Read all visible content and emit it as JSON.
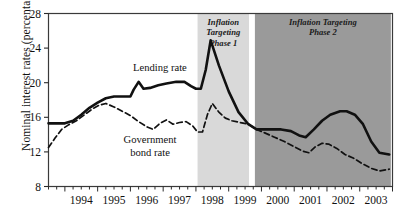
{
  "chart_data": {
    "type": "line",
    "title": "",
    "xlabel": "",
    "ylabel": "Nominal interest rates (percentages)",
    "ylim": [
      8,
      28
    ],
    "yticks": [
      8,
      12,
      16,
      20,
      24,
      28
    ],
    "xlim": [
      1993.5,
      2004.0
    ],
    "xticks": [
      1994,
      1995,
      1996,
      1997,
      1998,
      1999,
      2000,
      2001,
      2002,
      2003
    ],
    "xtick_labels": [
      "1994",
      "1995",
      "1996",
      "1997",
      "1998",
      "1999",
      "2000",
      "2001",
      "2002",
      "2003"
    ],
    "grid": false,
    "legend_position": "inline-annotations",
    "series": [
      {
        "name": "Lending rate",
        "style": "solid",
        "color": "#111111",
        "points": [
          [
            1993.5,
            15.3
          ],
          [
            1993.75,
            15.3
          ],
          [
            1994.0,
            15.3
          ],
          [
            1994.25,
            15.6
          ],
          [
            1994.5,
            16.3
          ],
          [
            1994.75,
            17.1
          ],
          [
            1995.0,
            17.7
          ],
          [
            1995.25,
            18.2
          ],
          [
            1995.5,
            18.4
          ],
          [
            1995.75,
            18.4
          ],
          [
            1996.0,
            18.4
          ],
          [
            1996.1,
            19.2
          ],
          [
            1996.25,
            20.1
          ],
          [
            1996.4,
            19.3
          ],
          [
            1996.6,
            19.4
          ],
          [
            1996.85,
            19.7
          ],
          [
            1997.1,
            19.9
          ],
          [
            1997.4,
            20.1
          ],
          [
            1997.65,
            20.1
          ],
          [
            1997.85,
            19.6
          ],
          [
            1998.0,
            19.3
          ],
          [
            1998.15,
            19.3
          ],
          [
            1998.3,
            21.5
          ],
          [
            1998.45,
            24.9
          ],
          [
            1998.7,
            22.0
          ],
          [
            1999.0,
            19.0
          ],
          [
            1999.3,
            16.6
          ],
          [
            1999.6,
            15.2
          ],
          [
            1999.85,
            14.6
          ],
          [
            2000.2,
            14.6
          ],
          [
            2000.6,
            14.6
          ],
          [
            2000.9,
            14.4
          ],
          [
            2001.15,
            13.9
          ],
          [
            2001.35,
            13.7
          ],
          [
            2001.6,
            14.6
          ],
          [
            2001.85,
            15.6
          ],
          [
            2002.1,
            16.3
          ],
          [
            2002.4,
            16.7
          ],
          [
            2002.6,
            16.7
          ],
          [
            2002.85,
            16.3
          ],
          [
            2003.1,
            15.2
          ],
          [
            2003.35,
            13.2
          ],
          [
            2003.6,
            11.9
          ],
          [
            2003.9,
            11.7
          ]
        ]
      },
      {
        "name": "Government bond rate",
        "style": "dashed",
        "color": "#111111",
        "points": [
          [
            1993.5,
            12.5
          ],
          [
            1993.7,
            13.6
          ],
          [
            1993.9,
            14.6
          ],
          [
            1994.1,
            15.1
          ],
          [
            1994.35,
            15.6
          ],
          [
            1994.6,
            16.3
          ],
          [
            1994.85,
            17.0
          ],
          [
            1995.05,
            17.4
          ],
          [
            1995.25,
            17.6
          ],
          [
            1995.5,
            17.2
          ],
          [
            1995.75,
            16.7
          ],
          [
            1996.0,
            16.2
          ],
          [
            1996.25,
            15.5
          ],
          [
            1996.5,
            14.9
          ],
          [
            1996.7,
            14.6
          ],
          [
            1996.9,
            15.3
          ],
          [
            1997.1,
            15.7
          ],
          [
            1997.3,
            15.2
          ],
          [
            1997.5,
            15.4
          ],
          [
            1997.7,
            15.5
          ],
          [
            1997.9,
            15.0
          ],
          [
            1998.05,
            14.3
          ],
          [
            1998.2,
            14.3
          ],
          [
            1998.35,
            16.3
          ],
          [
            1998.5,
            17.6
          ],
          [
            1998.7,
            16.6
          ],
          [
            1998.9,
            15.9
          ],
          [
            1999.1,
            15.6
          ],
          [
            1999.35,
            15.4
          ],
          [
            1999.6,
            15.2
          ],
          [
            1999.85,
            14.6
          ],
          [
            2000.1,
            14.2
          ],
          [
            2000.4,
            13.7
          ],
          [
            2000.7,
            13.2
          ],
          [
            2001.0,
            12.6
          ],
          [
            2001.25,
            12.1
          ],
          [
            2001.45,
            11.9
          ],
          [
            2001.65,
            12.6
          ],
          [
            2001.85,
            13.0
          ],
          [
            2002.05,
            12.9
          ],
          [
            2002.3,
            12.4
          ],
          [
            2002.55,
            11.7
          ],
          [
            2002.8,
            11.3
          ],
          [
            2003.05,
            10.7
          ],
          [
            2003.35,
            10.1
          ],
          [
            2003.6,
            9.8
          ],
          [
            2003.9,
            10.0
          ]
        ]
      }
    ],
    "annotations": [
      {
        "name": "lending-rate-label",
        "text": "Lending rate",
        "x": 1996.9,
        "y": 21.4
      },
      {
        "name": "government-bond-rate-label-line1",
        "text": "Government",
        "x": 1996.6,
        "y": 13.0
      },
      {
        "name": "government-bond-rate-label-line2",
        "text": "bond rate",
        "x": 1996.6,
        "y": 11.5
      }
    ],
    "shaded_bands": [
      {
        "name": "Inflation Targeting Phase 1",
        "label_lines": [
          "Inflation",
          "Targeting",
          "Phase 1"
        ],
        "x_start": 1998.05,
        "x_end": 1999.62,
        "color": "#d9d9d9"
      },
      {
        "name": "Inflation Targeting Phase 2",
        "label_lines": [
          "Inflation Targeting",
          "Phase 2"
        ],
        "x_start": 1999.8,
        "x_end": 2003.95,
        "color": "#9a9a9a"
      }
    ]
  }
}
